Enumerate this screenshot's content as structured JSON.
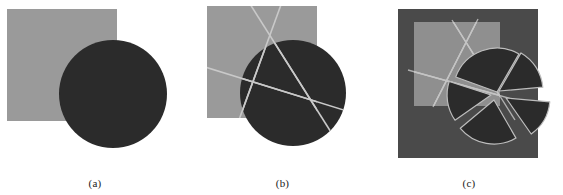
{
  "figure": {
    "background_color": "#ffffff",
    "width": 563,
    "height": 195,
    "caption_color": "#1a1a1a"
  },
  "palette": {
    "gray_square": "#9a9a9a",
    "dark_circle": "#2b2b2b",
    "panel_c_background": "#4a4a4a",
    "panel_c_square": "#8f8f8f",
    "line_light": "#c9c9c9",
    "outline_light": "#bdbdbd",
    "white": "#ffffff"
  },
  "panels": [
    {
      "id": "a",
      "caption": "(a)",
      "description": "gray square overlapped by a solid dark circle",
      "square": {
        "x": 7,
        "y": 9,
        "width": 110,
        "height": 112,
        "fill": "#9a9a9a"
      },
      "circle": {
        "cx": 113,
        "cy": 94,
        "r": 54,
        "fill": "#2b2b2b"
      },
      "lines": []
    },
    {
      "id": "b",
      "caption": "(b)",
      "description": "gray square and dark circle crossed by three straight cut lines meeting near the circle centre",
      "square": {
        "x": 17,
        "y": 6,
        "width": 110,
        "height": 112,
        "fill": "#9a9a9a"
      },
      "circle": {
        "cx": 103,
        "cy": 93,
        "r": 53,
        "fill": "#2b2b2b"
      },
      "lines": [
        {
          "name": "cut-line-1",
          "x1": 60,
          "y1": 4,
          "x2": 146,
          "y2": 140,
          "stroke": "#c9c9c9",
          "width": 1.6
        },
        {
          "name": "cut-line-2",
          "x1": 92,
          "y1": 2,
          "x2": 46,
          "y2": 128,
          "stroke": "#c9c9c9",
          "width": 1.6
        },
        {
          "name": "cut-line-3",
          "x1": 12,
          "y1": 66,
          "x2": 160,
          "y2": 112,
          "stroke": "#c9c9c9",
          "width": 1.6
        }
      ]
    },
    {
      "id": "c",
      "caption": "(c)",
      "description": "dark background plate with light square and circle split into separated pie wedges outlined in light gray",
      "plate": {
        "x": 23,
        "y": 9,
        "width": 140,
        "height": 149,
        "fill": "#4a4a4a"
      },
      "square": {
        "x": 39,
        "y": 22,
        "width": 86,
        "height": 84,
        "fill": "#8f8f8f"
      },
      "circle": {
        "cx": 122,
        "cy": 92,
        "r": 44,
        "fill": "#2b2b2b"
      },
      "lines": [
        {
          "name": "cut-line-1",
          "x1": 77,
          "y1": 20,
          "x2": 140,
          "y2": 120,
          "stroke": "#c9c9c9",
          "width": 1.4
        },
        {
          "name": "cut-line-2",
          "x1": 103,
          "y1": 19,
          "x2": 58,
          "y2": 107,
          "stroke": "#c9c9c9",
          "width": 1.4
        },
        {
          "name": "cut-line-3",
          "x1": 33,
          "y1": 70,
          "x2": 166,
          "y2": 107,
          "stroke": "#c9c9c9",
          "width": 1.4
        }
      ],
      "wedges": [
        {
          "name": "wedge-upper-left",
          "start_deg": 200,
          "end_deg": 300,
          "offset_x": 0,
          "offset_y": 0
        },
        {
          "name": "wedge-upper-right",
          "start_deg": 300,
          "end_deg": 355,
          "offset_x": 2,
          "offset_y": -1
        },
        {
          "name": "wedge-right",
          "start_deg": 5,
          "end_deg": 55,
          "offset_x": 9,
          "offset_y": 6
        },
        {
          "name": "wedge-bottom",
          "start_deg": 60,
          "end_deg": 140,
          "offset_x": -3,
          "offset_y": 8
        },
        {
          "name": "wedge-left",
          "start_deg": 145,
          "end_deg": 198,
          "offset_x": -6,
          "offset_y": 3
        }
      ]
    }
  ]
}
